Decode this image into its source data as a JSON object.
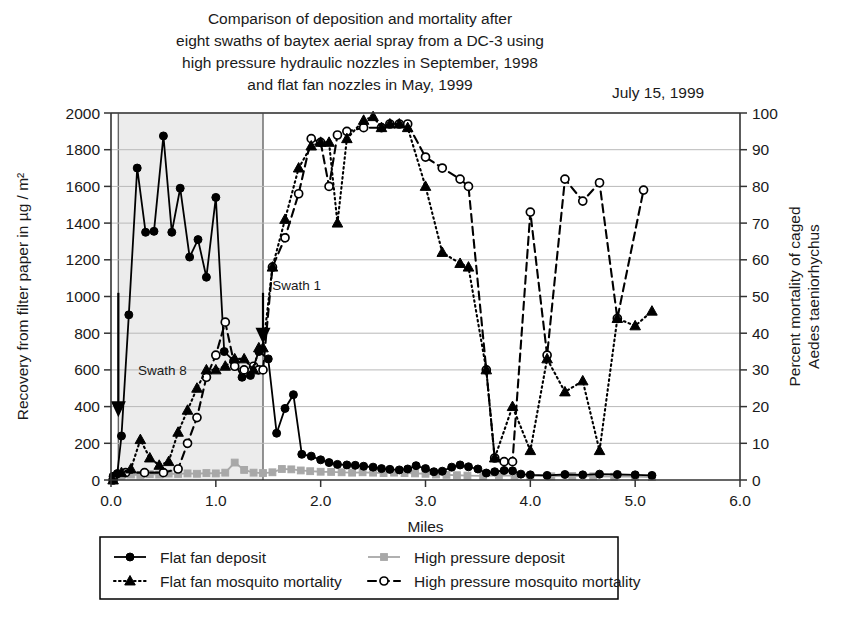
{
  "figure": {
    "title_lines": [
      "Comparison of deposition and mortality after",
      "eight swaths of baytex aerial spray from a DC-3 using",
      "high pressure hydraulic nozzles in September, 1998",
      "and flat fan nozzles in May, 1999"
    ],
    "date_stamp": "July 15, 1999"
  },
  "chart_data": {
    "type": "line",
    "title": "Comparison of deposition and mortality after eight swaths of baytex aerial spray from a DC-3 using high pressure hydraulic nozzles in September, 1998 and flat fan nozzles in May, 1999",
    "xlabel": "Miles",
    "ylabel": "Recovery from filter paper in µg / m²",
    "ylabel_right_lines": [
      "Percent mortality of caged",
      "Aedes taeniorhychus"
    ],
    "xlim": [
      0.0,
      6.0
    ],
    "ylim": [
      0,
      2000
    ],
    "ylim_right": [
      0,
      100
    ],
    "xticks": [
      "0.0",
      "1.0",
      "2.0",
      "3.0",
      "4.0",
      "5.0",
      "6.0"
    ],
    "xtick_values": [
      0,
      1,
      2,
      3,
      4,
      5,
      6
    ],
    "yticks": [
      "0",
      "200",
      "400",
      "600",
      "800",
      "1000",
      "1200",
      "1400",
      "1600",
      "1800",
      "2000"
    ],
    "ytick_values": [
      0,
      200,
      400,
      600,
      800,
      1000,
      1200,
      1400,
      1600,
      1800,
      2000
    ],
    "yticks_right": [
      "0",
      "10",
      "20",
      "30",
      "40",
      "50",
      "60",
      "70",
      "80",
      "90",
      "100"
    ],
    "ytick_right_values": [
      0,
      10,
      20,
      30,
      40,
      50,
      60,
      70,
      80,
      90,
      100
    ],
    "grid": "horizontal",
    "legend_position": "below",
    "shaded_band": {
      "x_start": 0.07,
      "x_end": 1.45,
      "color": "#ececec",
      "label": "spray swath block"
    },
    "annotations": [
      {
        "text": "Swath 8",
        "x": 0.22,
        "y": 600,
        "arrow_x": 0.07,
        "arrow_from_y": 1020,
        "arrow_to_y": 380
      },
      {
        "text": "Swath 1",
        "x": 1.5,
        "y": 1060,
        "arrow_x": 1.45,
        "arrow_from_y": 1020,
        "arrow_to_y": 780
      }
    ],
    "series": [
      {
        "name": "Flat fan deposit",
        "axis": "left",
        "color": "#000000",
        "line_style": "solid",
        "marker": "filled-circle",
        "points": [
          [
            0.02,
            20
          ],
          [
            0.06,
            35
          ],
          [
            0.1,
            240
          ],
          [
            0.17,
            900
          ],
          [
            0.25,
            1700
          ],
          [
            0.33,
            1350
          ],
          [
            0.41,
            1355
          ],
          [
            0.5,
            1875
          ],
          [
            0.58,
            1350
          ],
          [
            0.66,
            1590
          ],
          [
            0.75,
            1215
          ],
          [
            0.83,
            1310
          ],
          [
            0.91,
            1105
          ],
          [
            1.0,
            1540
          ],
          [
            1.08,
            700
          ],
          [
            1.17,
            650
          ],
          [
            1.25,
            560
          ],
          [
            1.33,
            570
          ],
          [
            1.41,
            700
          ],
          [
            1.5,
            660
          ],
          [
            1.58,
            255
          ],
          [
            1.66,
            390
          ],
          [
            1.74,
            465
          ],
          [
            1.82,
            140
          ],
          [
            1.91,
            130
          ],
          [
            2.0,
            110
          ],
          [
            2.08,
            95
          ],
          [
            2.16,
            85
          ],
          [
            2.25,
            82
          ],
          [
            2.33,
            80
          ],
          [
            2.41,
            75
          ],
          [
            2.5,
            70
          ],
          [
            2.58,
            62
          ],
          [
            2.66,
            58
          ],
          [
            2.75,
            55
          ],
          [
            2.83,
            60
          ],
          [
            2.91,
            78
          ],
          [
            3.0,
            62
          ],
          [
            3.08,
            45
          ],
          [
            3.16,
            48
          ],
          [
            3.25,
            70
          ],
          [
            3.33,
            82
          ],
          [
            3.41,
            72
          ],
          [
            3.5,
            60
          ],
          [
            3.58,
            38
          ],
          [
            3.66,
            45
          ],
          [
            3.75,
            52
          ],
          [
            3.83,
            50
          ],
          [
            3.91,
            32
          ],
          [
            4.0,
            28
          ],
          [
            4.16,
            25
          ],
          [
            4.33,
            30
          ],
          [
            4.5,
            28
          ],
          [
            4.66,
            32
          ],
          [
            4.83,
            30
          ],
          [
            5.0,
            28
          ],
          [
            5.16,
            25
          ]
        ]
      },
      {
        "name": "High pressure deposit",
        "axis": "left",
        "color": "#a8a8a8",
        "line_style": "solid",
        "marker": "filled-square",
        "points": [
          [
            0.02,
            15
          ],
          [
            0.1,
            22
          ],
          [
            0.19,
            30
          ],
          [
            0.28,
            28
          ],
          [
            0.37,
            32
          ],
          [
            0.46,
            30
          ],
          [
            0.55,
            35
          ],
          [
            0.64,
            33
          ],
          [
            0.73,
            36
          ],
          [
            0.82,
            34
          ],
          [
            0.91,
            38
          ],
          [
            1.0,
            36
          ],
          [
            1.09,
            40
          ],
          [
            1.18,
            95
          ],
          [
            1.27,
            55
          ],
          [
            1.36,
            40
          ],
          [
            1.45,
            38
          ],
          [
            1.54,
            42
          ],
          [
            1.63,
            60
          ],
          [
            1.72,
            58
          ],
          [
            1.81,
            52
          ],
          [
            1.9,
            48
          ],
          [
            2.0,
            45
          ],
          [
            2.1,
            44
          ],
          [
            2.2,
            42
          ],
          [
            2.3,
            40
          ],
          [
            2.4,
            42
          ],
          [
            2.5,
            40
          ],
          [
            2.6,
            38
          ],
          [
            2.7,
            40
          ],
          [
            2.8,
            38
          ],
          [
            2.9,
            36
          ],
          [
            3.0,
            34
          ],
          [
            3.1,
            30
          ],
          [
            3.2,
            28
          ],
          [
            3.3,
            26
          ],
          [
            3.4,
            24
          ],
          [
            3.55,
            22
          ],
          [
            3.7,
            25
          ],
          [
            3.85,
            24
          ],
          [
            4.0,
            22
          ],
          [
            4.2,
            20
          ],
          [
            4.4,
            22
          ],
          [
            4.6,
            20
          ],
          [
            4.8,
            18
          ],
          [
            5.0,
            18
          ],
          [
            5.16,
            16
          ]
        ]
      },
      {
        "name": "Flat fan mosquito mortality",
        "axis": "right",
        "color": "#000000",
        "line_style": "dotted",
        "marker": "filled-triangle",
        "points": [
          [
            0.02,
            0
          ],
          [
            0.1,
            2
          ],
          [
            0.19,
            3
          ],
          [
            0.28,
            11
          ],
          [
            0.37,
            6
          ],
          [
            0.46,
            4
          ],
          [
            0.55,
            5
          ],
          [
            0.64,
            13
          ],
          [
            0.73,
            19
          ],
          [
            0.82,
            25
          ],
          [
            0.91,
            30
          ],
          [
            1.0,
            30
          ],
          [
            1.09,
            31
          ],
          [
            1.18,
            33
          ],
          [
            1.27,
            33
          ],
          [
            1.36,
            30
          ],
          [
            1.41,
            36
          ],
          [
            1.45,
            36
          ],
          [
            1.54,
            58
          ],
          [
            1.66,
            71
          ],
          [
            1.79,
            85
          ],
          [
            1.91,
            91
          ],
          [
            2.0,
            92
          ],
          [
            2.08,
            92
          ],
          [
            2.16,
            70
          ],
          [
            2.25,
            93
          ],
          [
            2.41,
            98
          ],
          [
            2.5,
            99
          ],
          [
            2.58,
            96
          ],
          [
            2.66,
            97
          ],
          [
            2.75,
            97
          ],
          [
            2.83,
            96
          ],
          [
            3.0,
            80
          ],
          [
            3.16,
            62
          ],
          [
            3.33,
            59
          ],
          [
            3.41,
            58
          ],
          [
            3.58,
            30
          ],
          [
            3.66,
            6
          ],
          [
            3.83,
            20
          ],
          [
            4.0,
            8
          ],
          [
            4.16,
            33
          ],
          [
            4.33,
            24
          ],
          [
            4.5,
            27
          ],
          [
            4.66,
            8
          ],
          [
            4.83,
            44
          ],
          [
            5.0,
            42
          ],
          [
            5.16,
            46
          ]
        ]
      },
      {
        "name": "High pressure mosquito mortality",
        "axis": "right",
        "color": "#000000",
        "line_style": "dashed",
        "marker": "open-circle",
        "points": [
          [
            0.02,
            0
          ],
          [
            0.14,
            2
          ],
          [
            0.32,
            2
          ],
          [
            0.5,
            2
          ],
          [
            0.64,
            3
          ],
          [
            0.73,
            10
          ],
          [
            0.82,
            17
          ],
          [
            0.91,
            28
          ],
          [
            1.0,
            34
          ],
          [
            1.09,
            43
          ],
          [
            1.18,
            31
          ],
          [
            1.27,
            30
          ],
          [
            1.36,
            31
          ],
          [
            1.41,
            30
          ],
          [
            1.45,
            30
          ],
          [
            1.54,
            58
          ],
          [
            1.66,
            66
          ],
          [
            1.79,
            78
          ],
          [
            1.91,
            93
          ],
          [
            2.0,
            92
          ],
          [
            2.08,
            80
          ],
          [
            2.16,
            94
          ],
          [
            2.25,
            95
          ],
          [
            2.41,
            96
          ],
          [
            2.58,
            96
          ],
          [
            2.66,
            97
          ],
          [
            2.75,
            97
          ],
          [
            2.83,
            97
          ],
          [
            3.0,
            88
          ],
          [
            3.16,
            85
          ],
          [
            3.33,
            82
          ],
          [
            3.41,
            80
          ],
          [
            3.58,
            30
          ],
          [
            3.66,
            6
          ],
          [
            3.75,
            5
          ],
          [
            3.83,
            5
          ],
          [
            4.0,
            73
          ],
          [
            4.16,
            34
          ],
          [
            4.33,
            82
          ],
          [
            4.5,
            76
          ],
          [
            4.66,
            81
          ],
          [
            4.83,
            44
          ],
          [
            5.08,
            79
          ]
        ]
      }
    ],
    "legend": [
      {
        "label": "Flat fan deposit",
        "line_style": "solid",
        "marker": "filled-circle",
        "color": "#000000"
      },
      {
        "label": "High pressure deposit",
        "line_style": "solid",
        "marker": "filled-square",
        "color": "#a8a8a8"
      },
      {
        "label": "Flat fan mosquito mortality",
        "line_style": "dotted",
        "marker": "filled-triangle",
        "color": "#000000"
      },
      {
        "label": "High pressure mosquito mortality",
        "line_style": "dashed",
        "marker": "open-circle",
        "color": "#000000"
      }
    ]
  }
}
